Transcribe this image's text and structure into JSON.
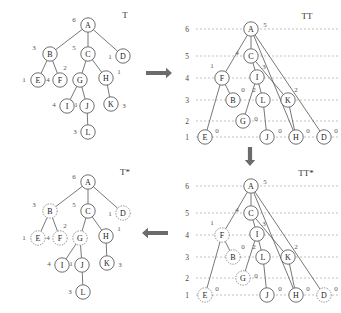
{
  "figure": {
    "panels": [
      {
        "id": "T",
        "title": "T",
        "title_pos": [
          125,
          15
        ],
        "gridlines": false,
        "nodes": [
          {
            "label": "A",
            "x": 88,
            "y": 25,
            "weight": "6",
            "wx": 74,
            "wy": 20,
            "style": "solid"
          },
          {
            "label": "B",
            "x": 50,
            "y": 54,
            "weight": "3",
            "wx": 34,
            "wy": 48,
            "style": "solid"
          },
          {
            "label": "C",
            "x": 88,
            "y": 54,
            "weight": "5",
            "wx": 74,
            "wy": 48,
            "style": "solid"
          },
          {
            "label": "D",
            "x": 123,
            "y": 56,
            "weight": "1",
            "wx": 110,
            "wy": 57,
            "style": "solid"
          },
          {
            "label": "E",
            "x": 38,
            "y": 80,
            "weight": "1",
            "wx": 24,
            "wy": 80,
            "style": "solid"
          },
          {
            "label": "F",
            "x": 60,
            "y": 80,
            "weight": "4",
            "wx": 48,
            "wy": 80,
            "style": "solid"
          },
          {
            "label": "G",
            "x": 80,
            "y": 80,
            "weight": "2",
            "wx": 65,
            "wy": 68,
            "style": "solid"
          },
          {
            "label": "H",
            "x": 106,
            "y": 78,
            "weight": "1",
            "wx": 119,
            "wy": 72,
            "style": "solid"
          },
          {
            "label": "I",
            "x": 67,
            "y": 106,
            "weight": "4",
            "wx": 54,
            "wy": 105,
            "style": "solid"
          },
          {
            "label": "J",
            "x": 87,
            "y": 106,
            "weight": "1",
            "wx": 76,
            "wy": 105,
            "style": "solid"
          },
          {
            "label": "K",
            "x": 111,
            "y": 104,
            "weight": "3",
            "wx": 124,
            "wy": 106,
            "style": "solid"
          },
          {
            "label": "L",
            "x": 88,
            "y": 132,
            "weight": "3",
            "wx": 75,
            "wy": 132,
            "style": "solid"
          }
        ],
        "edges": [
          [
            "A",
            "B"
          ],
          [
            "A",
            "C"
          ],
          [
            "A",
            "D"
          ],
          [
            "B",
            "E"
          ],
          [
            "B",
            "F"
          ],
          [
            "C",
            "G"
          ],
          [
            "C",
            "H"
          ],
          [
            "G",
            "I"
          ],
          [
            "G",
            "J"
          ],
          [
            "H",
            "K"
          ],
          [
            "J",
            "L"
          ]
        ]
      },
      {
        "id": "TT",
        "title": "TT",
        "title_pos": [
          307,
          16
        ],
        "gridlines": true,
        "axis_ticks": [
          {
            "label": "6",
            "y": 29
          },
          {
            "label": "5",
            "y": 56
          },
          {
            "label": "4",
            "y": 78
          },
          {
            "label": "3",
            "y": 100
          },
          {
            "label": "2",
            "y": 121
          },
          {
            "label": "1",
            "y": 137
          }
        ],
        "axis_x": 187,
        "grid_x1": 196,
        "grid_x2": 338,
        "nodes": [
          {
            "label": "A",
            "x": 251,
            "y": 29,
            "weight": "5",
            "wx": 265,
            "wy": 25,
            "style": "solid"
          },
          {
            "label": "C",
            "x": 251,
            "y": 56,
            "weight": "4",
            "wx": 237,
            "wy": 53,
            "style": "solid"
          },
          {
            "label": "F",
            "x": 222,
            "y": 78,
            "weight": "1",
            "wx": 212,
            "wy": 66,
            "style": "solid"
          },
          {
            "label": "I",
            "x": 257,
            "y": 77,
            "weight": "3",
            "wx": 264,
            "wy": 67,
            "style": "solid"
          },
          {
            "label": "B",
            "x": 233,
            "y": 100,
            "weight": "0",
            "wx": 243,
            "wy": 90,
            "style": "solid"
          },
          {
            "label": "L",
            "x": 263,
            "y": 100,
            "weight": "2",
            "wx": 254,
            "wy": 90,
            "style": "solid"
          },
          {
            "label": "K",
            "x": 288,
            "y": 100,
            "weight": "2",
            "wx": 296,
            "wy": 90,
            "style": "solid"
          },
          {
            "label": "G",
            "x": 243,
            "y": 121,
            "weight": "0",
            "wx": 256,
            "wy": 119,
            "style": "solid"
          },
          {
            "label": "E",
            "x": 205,
            "y": 137,
            "weight": "0",
            "wx": 217,
            "wy": 131,
            "style": "solid"
          },
          {
            "label": "J",
            "x": 267,
            "y": 137,
            "weight": "0",
            "wx": 280,
            "wy": 131,
            "style": "solid"
          },
          {
            "label": "H",
            "x": 296,
            "y": 137,
            "weight": "0",
            "wx": 308,
            "wy": 131,
            "style": "solid"
          },
          {
            "label": "D",
            "x": 324,
            "y": 137,
            "weight": "0",
            "wx": 336,
            "wy": 131,
            "style": "solid"
          }
        ],
        "edges": [
          [
            "A",
            "C"
          ],
          [
            "A",
            "F"
          ],
          [
            "A",
            "H"
          ],
          [
            "A",
            "D"
          ],
          [
            "C",
            "I"
          ],
          [
            "C",
            "K"
          ],
          [
            "F",
            "B"
          ],
          [
            "F",
            "E"
          ],
          [
            "I",
            "L"
          ],
          [
            "I",
            "G"
          ],
          [
            "L",
            "J"
          ],
          [
            "K",
            "H"
          ]
        ]
      },
      {
        "id": "Tstar",
        "title": "T*",
        "title_pos": [
          125,
          172
        ],
        "gridlines": false,
        "nodes": [
          {
            "label": "A",
            "x": 88,
            "y": 182,
            "weight": "6",
            "wx": 74,
            "wy": 177,
            "style": "solid"
          },
          {
            "label": "B",
            "x": 50,
            "y": 211,
            "weight": "3",
            "wx": 34,
            "wy": 205,
            "style": "dotted"
          },
          {
            "label": "C",
            "x": 88,
            "y": 211,
            "weight": "5",
            "wx": 74,
            "wy": 205,
            "style": "solid"
          },
          {
            "label": "D",
            "x": 123,
            "y": 213,
            "weight": "1",
            "wx": 110,
            "wy": 214,
            "style": "dotted"
          },
          {
            "label": "E",
            "x": 38,
            "y": 238,
            "weight": "1",
            "wx": 24,
            "wy": 238,
            "style": "dotted"
          },
          {
            "label": "F",
            "x": 60,
            "y": 238,
            "weight": "4",
            "wx": 48,
            "wy": 238,
            "style": "dotted"
          },
          {
            "label": "G",
            "x": 80,
            "y": 238,
            "weight": "2",
            "wx": 65,
            "wy": 226,
            "style": "dotted"
          },
          {
            "label": "H",
            "x": 106,
            "y": 236,
            "weight": "1",
            "wx": 119,
            "wy": 229,
            "style": "solid"
          },
          {
            "label": "I",
            "x": 62,
            "y": 265,
            "weight": "4",
            "wx": 49,
            "wy": 264,
            "style": "solid"
          },
          {
            "label": "J",
            "x": 82,
            "y": 265,
            "weight": "1",
            "wx": 71,
            "wy": 264,
            "style": "solid"
          },
          {
            "label": "K",
            "x": 107,
            "y": 263,
            "weight": "3",
            "wx": 120,
            "wy": 265,
            "style": "solid"
          },
          {
            "label": "L",
            "x": 83,
            "y": 292,
            "weight": "3",
            "wx": 70,
            "wy": 292,
            "style": "solid"
          }
        ],
        "edges": [
          [
            "A",
            "B"
          ],
          [
            "A",
            "C"
          ],
          [
            "A",
            "D"
          ],
          [
            "B",
            "E"
          ],
          [
            "B",
            "F"
          ],
          [
            "C",
            "G"
          ],
          [
            "C",
            "H"
          ],
          [
            "G",
            "I"
          ],
          [
            "G",
            "J"
          ],
          [
            "H",
            "K"
          ],
          [
            "J",
            "L"
          ]
        ]
      },
      {
        "id": "TTstar",
        "title": "TT*",
        "title_pos": [
          306,
          173
        ],
        "gridlines": true,
        "axis_ticks": [
          {
            "label": "6",
            "y": 186
          },
          {
            "label": "5",
            "y": 213
          },
          {
            "label": "4",
            "y": 235
          },
          {
            "label": "3",
            "y": 257
          },
          {
            "label": "2",
            "y": 278
          },
          {
            "label": "1",
            "y": 295
          }
        ],
        "axis_x": 187,
        "grid_x1": 196,
        "grid_x2": 338,
        "nodes": [
          {
            "label": "A",
            "x": 251,
            "y": 186,
            "weight": "5",
            "wx": 265,
            "wy": 182,
            "style": "solid"
          },
          {
            "label": "C",
            "x": 251,
            "y": 213,
            "weight": "4",
            "wx": 237,
            "wy": 210,
            "style": "solid"
          },
          {
            "label": "F",
            "x": 222,
            "y": 235,
            "weight": "1",
            "wx": 212,
            "wy": 223,
            "style": "dotted"
          },
          {
            "label": "I",
            "x": 257,
            "y": 234,
            "weight": "3",
            "wx": 264,
            "wy": 224,
            "style": "solid"
          },
          {
            "label": "B",
            "x": 233,
            "y": 257,
            "weight": "0",
            "wx": 243,
            "wy": 247,
            "style": "dotted"
          },
          {
            "label": "L",
            "x": 263,
            "y": 257,
            "weight": "2",
            "wx": 254,
            "wy": 247,
            "style": "solid"
          },
          {
            "label": "K",
            "x": 288,
            "y": 257,
            "weight": "2",
            "wx": 296,
            "wy": 247,
            "style": "solid"
          },
          {
            "label": "G",
            "x": 243,
            "y": 278,
            "weight": "0",
            "wx": 256,
            "wy": 276,
            "style": "dotted"
          },
          {
            "label": "E",
            "x": 205,
            "y": 295,
            "weight": "0",
            "wx": 217,
            "wy": 289,
            "style": "dotted"
          },
          {
            "label": "J",
            "x": 267,
            "y": 295,
            "weight": "0",
            "wx": 280,
            "wy": 289,
            "style": "solid"
          },
          {
            "label": "H",
            "x": 296,
            "y": 295,
            "weight": "0",
            "wx": 308,
            "wy": 289,
            "style": "solid"
          },
          {
            "label": "D",
            "x": 324,
            "y": 295,
            "weight": "0",
            "wx": 336,
            "wy": 289,
            "style": "dotted"
          }
        ],
        "edges": [
          [
            "A",
            "C"
          ],
          [
            "A",
            "F"
          ],
          [
            "A",
            "H"
          ],
          [
            "A",
            "D"
          ],
          [
            "C",
            "I"
          ],
          [
            "C",
            "K"
          ],
          [
            "F",
            "B"
          ],
          [
            "F",
            "E"
          ],
          [
            "I",
            "L"
          ],
          [
            "I",
            "G"
          ],
          [
            "L",
            "J"
          ],
          [
            "K",
            "H"
          ]
        ]
      }
    ],
    "arrows": [
      {
        "name": "arrow-t-to-tt",
        "dir": "right",
        "x": 146,
        "y": 73,
        "len": 26
      },
      {
        "name": "arrow-tt-to-ttstar",
        "dir": "down",
        "x": 250,
        "y": 147,
        "len": 19
      },
      {
        "name": "arrow-ttstar-to-tstar",
        "dir": "left",
        "x": 142,
        "y": 233,
        "len": 26
      }
    ]
  }
}
